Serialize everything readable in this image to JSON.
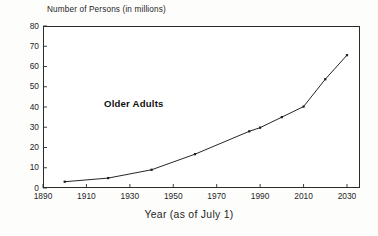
{
  "chart_data": {
    "type": "line",
    "title": "",
    "ylabel": "Number of Persons (in millions)",
    "xlabel": "Year (as of July 1)",
    "xlim": [
      1890,
      2036
    ],
    "ylim": [
      0,
      80
    ],
    "grid": false,
    "legend_position": "inline-annotation",
    "series": [
      {
        "name": "Older Adults",
        "x": [
          1900,
          1920,
          1940,
          1960,
          1985,
          1990,
          2000,
          2010,
          2020,
          2030
        ],
        "values": [
          3.1,
          4.9,
          9.0,
          16.7,
          28.0,
          29.8,
          35.0,
          40.2,
          53.7,
          65.6
        ],
        "color": "#1a1a1a",
        "marker": "square"
      }
    ],
    "annotations": [
      {
        "text": "Older Adults",
        "x": 1935,
        "y": 55
      }
    ],
    "ytick_labels": [
      "0",
      "10",
      "20",
      "30",
      "40",
      "50",
      "60",
      "70",
      "80"
    ],
    "ytick_values": [
      0,
      10,
      20,
      30,
      40,
      50,
      60,
      70,
      80
    ],
    "xtick_labels": [
      "1890",
      "1910",
      "1930",
      "1950",
      "1970",
      "1990",
      "2010",
      "2030"
    ],
    "xtick_values": [
      1890,
      1910,
      1930,
      1950,
      1970,
      1990,
      2010,
      2030
    ]
  },
  "axis": {
    "y_title": "Number of Persons (in millions)",
    "x_title": "Year (as of July 1)"
  },
  "annotation": {
    "series_label": "Older Adults"
  },
  "colors": {
    "line": "#1a1a1a",
    "frame": "#2b2b2b",
    "text": "#1f1f1f",
    "background": "#ffffff"
  }
}
